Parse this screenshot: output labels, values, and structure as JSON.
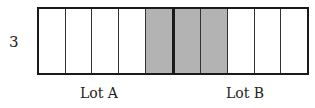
{
  "diagram": {
    "side_label": "3",
    "cells_total": 10,
    "shaded_cells": [
      5,
      6,
      7
    ],
    "divider_after_cell": 5,
    "shade_color": "#b3b3b3",
    "lots": [
      {
        "label": "Lot A",
        "cells": [
          1,
          2,
          3,
          4,
          5
        ]
      },
      {
        "label": "Lot B",
        "cells": [
          6,
          7,
          8,
          9,
          10
        ]
      }
    ]
  }
}
